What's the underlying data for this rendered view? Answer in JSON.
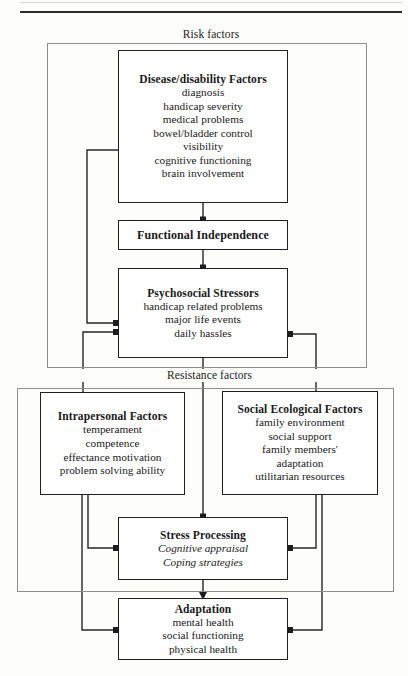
{
  "diagram": {
    "frames": [
      {
        "id": "risk",
        "label": "Risk factors"
      },
      {
        "id": "resistance",
        "label": "Resistance factors"
      }
    ],
    "nodes": [
      {
        "id": "disease",
        "title": "Disease/disability Factors",
        "items": [
          "diagnosis",
          "handicap severity",
          "medical problems",
          "bowel/bladder control",
          "visibility",
          "cognitive functioning",
          "brain involvement"
        ],
        "italic_items": []
      },
      {
        "id": "functional",
        "title": "Functional Independence",
        "items": [],
        "italic_items": []
      },
      {
        "id": "psychosocial",
        "title": "Psychosocial Stressors",
        "items": [
          "handicap related problems",
          "major life events",
          "daily hassles"
        ],
        "italic_items": []
      },
      {
        "id": "intrapersonal",
        "title": "Intrapersonal Factors",
        "items": [
          "temperament",
          "competence",
          "effectance motivation",
          "problem solving ability"
        ],
        "italic_items": []
      },
      {
        "id": "social",
        "title": "Social Ecological Factors",
        "items": [
          "family environment",
          "social support",
          "family members'",
          "adaptation",
          "utilitarian resources"
        ],
        "italic_items": []
      },
      {
        "id": "stress",
        "title": "Stress Processing",
        "items": [],
        "italic_items": [
          "Cognitive appraisal",
          "Coping strategies"
        ]
      },
      {
        "id": "adaptation",
        "title": "Adaptation",
        "items": [
          "mental health",
          "social functioning",
          "physical health"
        ],
        "italic_items": []
      }
    ],
    "colors": {
      "ink": "#1f1f1f",
      "frame": "#8f8f8a",
      "paper": "#fdfdfc"
    }
  }
}
